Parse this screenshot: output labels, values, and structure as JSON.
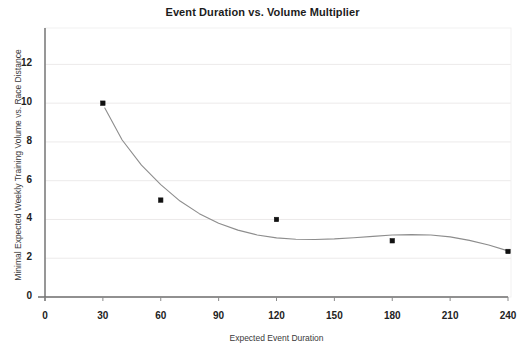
{
  "chart_data": {
    "type": "scatter",
    "title": "Event Duration vs. Volume Multiplier",
    "xlabel": "Expected Event Duration",
    "ylabel": "Minimal Expected Weekly Training Volume vs. Race Distance",
    "xlim": [
      0,
      240
    ],
    "ylim": [
      0,
      13
    ],
    "xticks": [
      0,
      30,
      60,
      90,
      120,
      150,
      180,
      210,
      240
    ],
    "yticks": [
      0,
      2,
      4,
      6,
      8,
      10,
      12
    ],
    "grid": "horizontal-faint",
    "legend": "none",
    "series": [
      {
        "name": "Observed points",
        "marker": "square",
        "marker_color": "#111111",
        "points": [
          {
            "x": 30,
            "y": 10.0
          },
          {
            "x": 60,
            "y": 5.0
          },
          {
            "x": 120,
            "y": 4.0
          },
          {
            "x": 180,
            "y": 2.9
          },
          {
            "x": 240,
            "y": 2.35
          }
        ]
      },
      {
        "name": "Fitted curve",
        "marker": "none",
        "line_color": "#8d8d8d",
        "points": [
          {
            "x": 31,
            "y": 9.75
          },
          {
            "x": 40,
            "y": 8.1
          },
          {
            "x": 50,
            "y": 6.8
          },
          {
            "x": 60,
            "y": 5.8
          },
          {
            "x": 70,
            "y": 4.95
          },
          {
            "x": 80,
            "y": 4.3
          },
          {
            "x": 90,
            "y": 3.8
          },
          {
            "x": 100,
            "y": 3.45
          },
          {
            "x": 110,
            "y": 3.2
          },
          {
            "x": 120,
            "y": 3.05
          },
          {
            "x": 130,
            "y": 2.98
          },
          {
            "x": 140,
            "y": 2.97
          },
          {
            "x": 150,
            "y": 3.0
          },
          {
            "x": 160,
            "y": 3.06
          },
          {
            "x": 170,
            "y": 3.13
          },
          {
            "x": 180,
            "y": 3.2
          },
          {
            "x": 190,
            "y": 3.22
          },
          {
            "x": 200,
            "y": 3.2
          },
          {
            "x": 210,
            "y": 3.1
          },
          {
            "x": 220,
            "y": 2.92
          },
          {
            "x": 230,
            "y": 2.68
          },
          {
            "x": 240,
            "y": 2.38
          }
        ]
      }
    ]
  },
  "axes": {
    "y_tick_labels": [
      "12",
      "10",
      "8",
      "6",
      "4",
      "2",
      "0"
    ],
    "x_tick_labels": [
      "0",
      "30",
      "60",
      "90",
      "120",
      "150",
      "180",
      "210",
      "240"
    ]
  }
}
